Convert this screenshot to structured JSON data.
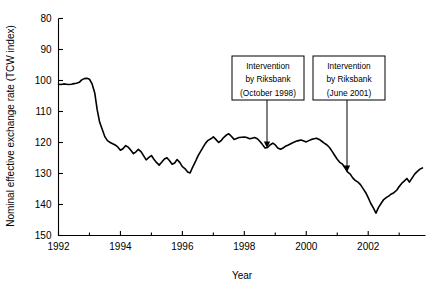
{
  "chart_data": {
    "type": "line",
    "title": "",
    "xlabel": "Year",
    "ylabel": "Nominal effective exchange rate (TCW index)",
    "xlim": [
      1992.0,
      2003.85
    ],
    "ylim": [
      80,
      150
    ],
    "y_axis_inverted": true,
    "grid": false,
    "legend": "none",
    "x_ticks_major": [
      1992,
      1994,
      1996,
      1998,
      2000,
      2002
    ],
    "x_tick_labels": [
      "1992",
      "1994",
      "1996",
      "1998",
      "2000",
      "2002"
    ],
    "x_ticks_minor": [
      1993,
      1995,
      1997,
      1999,
      2001,
      2003
    ],
    "y_ticks": [
      80,
      90,
      100,
      110,
      120,
      130,
      140,
      150
    ],
    "y_tick_labels": [
      "80",
      "90",
      "100",
      "110",
      "120",
      "130",
      "140",
      "150"
    ],
    "series": [
      {
        "name": "Nominal effective exchange rate (TCW index)",
        "color": "#000000",
        "x": [
          1992.0,
          1992.08,
          1992.17,
          1992.25,
          1992.33,
          1992.42,
          1992.5,
          1992.58,
          1992.67,
          1992.75,
          1992.83,
          1992.92,
          1993.0,
          1993.08,
          1993.17,
          1993.25,
          1993.33,
          1993.42,
          1993.5,
          1993.58,
          1993.67,
          1993.75,
          1993.83,
          1993.92,
          1994.0,
          1994.08,
          1994.17,
          1994.25,
          1994.33,
          1994.42,
          1994.5,
          1994.58,
          1994.67,
          1994.75,
          1994.83,
          1994.92,
          1995.0,
          1995.08,
          1995.17,
          1995.25,
          1995.33,
          1995.42,
          1995.5,
          1995.58,
          1995.67,
          1995.75,
          1995.83,
          1995.92,
          1996.0,
          1996.08,
          1996.17,
          1996.25,
          1996.33,
          1996.42,
          1996.5,
          1996.58,
          1996.67,
          1996.75,
          1996.83,
          1996.92,
          1997.0,
          1997.08,
          1997.17,
          1997.25,
          1997.33,
          1997.42,
          1997.5,
          1997.58,
          1997.67,
          1997.75,
          1997.83,
          1997.92,
          1998.0,
          1998.08,
          1998.17,
          1998.25,
          1998.33,
          1998.42,
          1998.5,
          1998.58,
          1998.67,
          1998.75,
          1998.83,
          1998.92,
          1999.0,
          1999.08,
          1999.17,
          1999.25,
          1999.33,
          1999.42,
          1999.5,
          1999.58,
          1999.67,
          1999.75,
          1999.83,
          1999.92,
          2000.0,
          2000.08,
          2000.17,
          2000.25,
          2000.33,
          2000.42,
          2000.5,
          2000.58,
          2000.67,
          2000.75,
          2000.83,
          2000.92,
          2001.0,
          2001.08,
          2001.17,
          2001.25,
          2001.33,
          2001.42,
          2001.5,
          2001.58,
          2001.67,
          2001.75,
          2001.83,
          2001.92,
          2002.0,
          2002.08,
          2002.17,
          2002.25,
          2002.33,
          2002.42,
          2002.5,
          2002.58,
          2002.67,
          2002.75,
          2002.83,
          2002.92,
          2003.0,
          2003.08,
          2003.17,
          2003.25,
          2003.33,
          2003.42,
          2003.5,
          2003.58,
          2003.67,
          2003.75
        ],
        "y": [
          101.2,
          101.3,
          101.1,
          101.2,
          101.3,
          101.2,
          101.0,
          100.9,
          100.6,
          99.8,
          99.4,
          99.3,
          99.6,
          101.0,
          104.0,
          109.5,
          113.5,
          116.0,
          118.2,
          119.4,
          120.0,
          120.4,
          120.8,
          121.5,
          122.5,
          122.0,
          121.0,
          121.5,
          122.4,
          123.6,
          123.0,
          122.2,
          123.0,
          124.3,
          125.6,
          124.8,
          124.2,
          125.4,
          126.5,
          127.3,
          126.4,
          125.3,
          124.9,
          125.8,
          127.0,
          126.6,
          125.5,
          126.5,
          127.8,
          128.4,
          129.5,
          129.8,
          128.0,
          126.2,
          124.4,
          123.0,
          121.5,
          120.2,
          119.3,
          118.8,
          118.2,
          119.0,
          120.0,
          119.4,
          118.4,
          117.6,
          117.2,
          118.0,
          119.0,
          118.7,
          118.4,
          118.3,
          118.2,
          118.4,
          118.8,
          118.6,
          118.4,
          118.8,
          119.6,
          120.6,
          121.8,
          121.6,
          120.8,
          120.2,
          120.8,
          121.8,
          122.2,
          121.8,
          121.2,
          120.8,
          120.4,
          120.0,
          119.6,
          119.4,
          119.2,
          119.5,
          119.8,
          119.4,
          119.0,
          118.8,
          118.6,
          119.0,
          119.6,
          120.2,
          120.8,
          121.6,
          122.8,
          124.2,
          125.4,
          126.4,
          127.0,
          128.2,
          129.5,
          130.2,
          131.4,
          132.2,
          132.8,
          133.6,
          134.8,
          136.2,
          137.8,
          139.6,
          141.2,
          142.8,
          141.0,
          139.6,
          138.4,
          137.8,
          137.2,
          136.6,
          136.2,
          135.4,
          134.2,
          133.2,
          132.4,
          131.6,
          132.8,
          131.4,
          130.2,
          129.4,
          128.6,
          128.2
        ]
      }
    ],
    "annotations": [
      {
        "id": "intervention-1998",
        "lines": [
          "Intervention",
          "by Riksbank",
          "(October 1998)"
        ],
        "box_x": 232,
        "box_y": 56,
        "box_w": 72,
        "box_h": 44,
        "leader_from_x": 267,
        "leader_from_y": 100,
        "leader_to_x": 267,
        "leader_to_y": 148
      },
      {
        "id": "intervention-2001",
        "lines": [
          "Intervention",
          "by Riksbank",
          "(June 2001)"
        ],
        "box_x": 313,
        "box_y": 56,
        "box_w": 72,
        "box_h": 44,
        "leader_from_x": 347,
        "leader_from_y": 100,
        "leader_to_x": 347,
        "leader_to_y": 172
      }
    ]
  },
  "axes": {
    "x_title": "Year",
    "y_title": "Nominal effective exchange rate (TCW index)"
  }
}
